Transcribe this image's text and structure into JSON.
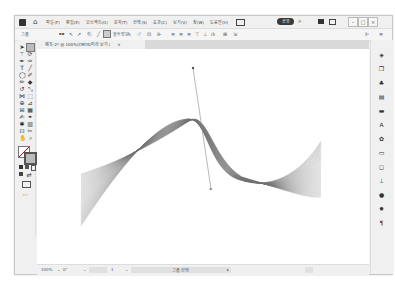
{
  "menubar": {
    "items": [
      "파일(F)",
      "편집(E)",
      "오브젝트(O)",
      "문자(T)",
      "선택(S)",
      "효과(C)",
      "보기(V)",
      "창(W)",
      "도움말(H)"
    ],
    "share_label": "공유",
    "window_controls": [
      "–",
      "□",
      "×"
    ]
  },
  "control_bar": {
    "selection_label": "그룹",
    "stroke_label": "획:",
    "opacity_label": "불투명도",
    "style_label": "스타일:",
    "right_label": "ㅣ"
  },
  "document_tab": {
    "title": "제목-2* @ 100%(CMYK/미리 보기)",
    "close": "×"
  },
  "tools": [
    "selection-tool",
    "direct-selection-tool",
    "magic-wand-tool",
    "lasso-tool",
    "pen-tool",
    "curvature-tool",
    "type-tool",
    "line-tool",
    "rectangle-tool",
    "paintbrush-tool",
    "shaper-tool",
    "pencil-tool",
    "eraser-tool",
    "rotate-tool",
    "scale-tool",
    "width-tool",
    "free-transform-tool",
    "shape-builder-tool",
    "perspective-tool",
    "mesh-tool",
    "gradient-tool",
    "eyedropper-tool",
    "blend-tool",
    "symbol-sprayer-tool",
    "column-graph-tool",
    "artboard-tool",
    "slice-tool",
    "hand-tool",
    "zoom-tool"
  ],
  "right_panel": {
    "items": [
      "properties",
      "layers",
      "libraries",
      "color",
      "swatches",
      "character",
      "symbols",
      "stroke",
      "transparency",
      "align",
      "appearance",
      "graphic-styles",
      "paragraph"
    ]
  },
  "status_bar": {
    "zoom": "100%",
    "rotation": "0°",
    "artboard": "1",
    "status_label": "그룹 선택"
  },
  "colors": {
    "ui_bg": "#f0f0f0",
    "canvas": "#ffffff",
    "share_button": "#3a3a3a",
    "blend_stroke": "#6e6e6e",
    "handle": "#888888"
  }
}
